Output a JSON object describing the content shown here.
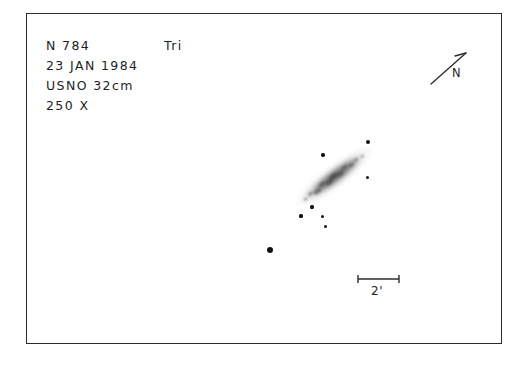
{
  "sheet": {
    "background_color": "#ffffff",
    "frame_color": "#2b2b2b",
    "ink_color": "#1e1e1e"
  },
  "annotation": {
    "object_designation": "N 784",
    "constellation": "Tri",
    "observation_date": "23 JAN 1984",
    "instrument": "USNO 32cm",
    "magnification": "250 X"
  },
  "orientation": {
    "north_label": "N",
    "arrow_icon": "north-arrow-icon",
    "arrow_bearing_deg": 41
  },
  "scale": {
    "label": "2'",
    "value": 2,
    "unit": "arcminutes",
    "bar_length_px": 42
  },
  "chart_data": {
    "type": "scatter",
    "title": "N 784  Tri",
    "xlabel": "",
    "ylabel": "",
    "xlim": [
      0,
      476
    ],
    "ylim": [
      0,
      331
    ],
    "grid": false,
    "legend": "none",
    "annotations": [
      "N 784",
      "Tri",
      "23 JAN 1984",
      "USNO 32cm",
      "250 X",
      "2'",
      "N"
    ],
    "galaxy": {
      "name": "N 784",
      "morphology": "edge-on spindle",
      "center_x": 308,
      "center_y": 164,
      "length_px": 96,
      "width_px": 22,
      "position_angle_deg": -37,
      "surface_brightness": "faint mottled"
    },
    "stars": [
      {
        "x": 342,
        "y": 129,
        "size": 4.4,
        "note": "bright star NE of galaxy tip"
      },
      {
        "x": 297,
        "y": 142,
        "size": 3.4,
        "note": "star N of galaxy"
      },
      {
        "x": 341,
        "y": 164,
        "size": 3.0,
        "note": "star E of galaxy"
      },
      {
        "x": 286,
        "y": 194,
        "size": 3.2,
        "note": "star SW near galaxy tip"
      },
      {
        "x": 275,
        "y": 203,
        "size": 3.2,
        "note": "star SW"
      },
      {
        "x": 296,
        "y": 203,
        "size": 3.0,
        "note": "star S"
      },
      {
        "x": 299,
        "y": 213,
        "size": 3.0,
        "note": "star S lower"
      },
      {
        "x": 244,
        "y": 237,
        "size": 6.2,
        "note": "brightest field star SW"
      }
    ]
  }
}
